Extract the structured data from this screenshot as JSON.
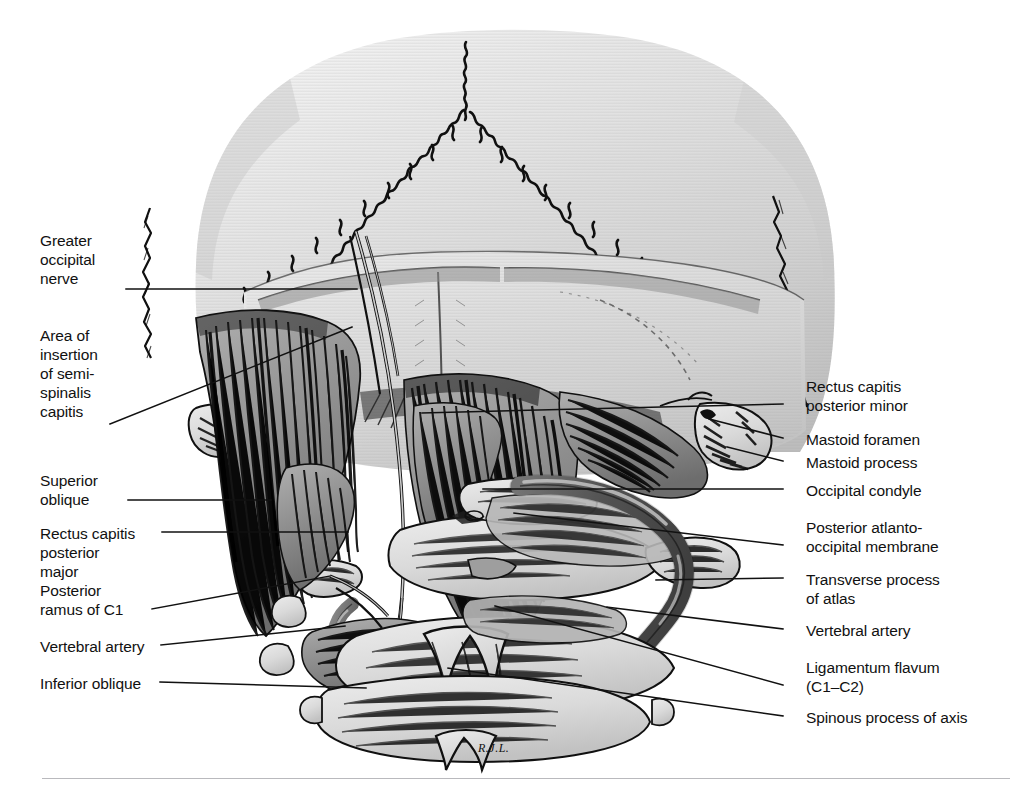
{
  "figure": {
    "artist_signature": "R.J.L.",
    "background_color": "#ffffff",
    "ink_color": "#000000",
    "bone_fill": "#d8d8d8",
    "muscle_fill": "#9a9a9a",
    "artery_fill": "#6f6f6f"
  },
  "labels_left": [
    {
      "id": "greater-occipital-nerve",
      "text": "Greater\noccipital\nnerve",
      "x": 40,
      "y": 231,
      "leader_from_x": 126,
      "leader_from_y": 289,
      "leader_to_x": 357,
      "leader_to_y": 289
    },
    {
      "id": "area-of-insertion-of-semispinalis-capitis",
      "text": "Area of\ninsertion\nof semi-\nspinalis\ncapitis",
      "x": 40,
      "y": 326,
      "leader_from_x": 110,
      "leader_from_y": 424,
      "leader_to_x": 352,
      "leader_to_y": 327
    },
    {
      "id": "superior-oblique",
      "text": "Superior\noblique",
      "x": 40,
      "y": 471,
      "leader_from_x": 128,
      "leader_from_y": 500,
      "leader_to_x": 271,
      "leader_to_y": 500
    },
    {
      "id": "rectus-capitis-posterior-major",
      "text": "Rectus capitis\nposterior\nmajor",
      "x": 40,
      "y": 524,
      "leader_from_x": 162,
      "leader_from_y": 532,
      "leader_to_x": 348,
      "leader_to_y": 532
    },
    {
      "id": "posterior-ramus-of-c1",
      "text": "Posterior\nramus of C1",
      "x": 40,
      "y": 581,
      "leader_from_x": 152,
      "leader_from_y": 609,
      "leader_to_x": 330,
      "leader_to_y": 576
    },
    {
      "id": "vertebral-artery",
      "text": "Vertebral artery",
      "x": 40,
      "y": 637,
      "leader_from_x": 161,
      "leader_from_y": 645,
      "leader_to_x": 345,
      "leader_to_y": 626
    },
    {
      "id": "inferior-oblique",
      "text": "Inferior oblique",
      "x": 40,
      "y": 674,
      "leader_from_x": 160,
      "leader_from_y": 682,
      "leader_to_x": 366,
      "leader_to_y": 688
    }
  ],
  "labels_right": [
    {
      "id": "rectus-capitis-posterior-minor",
      "text": "Rectus capitis\nposterior minor",
      "x": 806,
      "y": 377,
      "leader_from_x": 783,
      "leader_from_y": 404,
      "leader_to_x": 422,
      "leader_to_y": 413
    },
    {
      "id": "mastoid-foramen",
      "text": "Mastoid foramen",
      "x": 806,
      "y": 430,
      "leader_from_x": 783,
      "leader_from_y": 438,
      "leader_to_x": 709,
      "leader_to_y": 419
    },
    {
      "id": "mastoid-process",
      "text": "Mastoid process",
      "x": 806,
      "y": 453,
      "leader_from_x": 783,
      "leader_from_y": 461,
      "leader_to_x": 727,
      "leader_to_y": 447
    },
    {
      "id": "occipital-condyle",
      "text": "Occipital condyle",
      "x": 806,
      "y": 481,
      "leader_from_x": 783,
      "leader_from_y": 489,
      "leader_to_x": 483,
      "leader_to_y": 489
    },
    {
      "id": "posterior-atlanto-occipital-membrane",
      "text": "Posterior atlanto-\noccipital membrane",
      "x": 806,
      "y": 518,
      "leader_from_x": 783,
      "leader_from_y": 545,
      "leader_to_x": 514,
      "leader_to_y": 513
    },
    {
      "id": "transverse-process-of-atlas",
      "text": "Transverse process\nof atlas",
      "x": 806,
      "y": 570,
      "leader_from_x": 783,
      "leader_from_y": 578,
      "leader_to_x": 656,
      "leader_to_y": 580
    },
    {
      "id": "vertebral-artery-right",
      "text": "Vertebral artery",
      "x": 806,
      "y": 621,
      "leader_from_x": 783,
      "leader_from_y": 629,
      "leader_to_x": 607,
      "leader_to_y": 607
    },
    {
      "id": "ligamentum-flavum",
      "text": "Ligamentum flavum\n(C1–C2)",
      "x": 806,
      "y": 658,
      "leader_from_x": 783,
      "leader_from_y": 685,
      "leader_to_x": 495,
      "leader_to_y": 606
    },
    {
      "id": "spinous-process-of-axis",
      "text": "Spinous process of axis",
      "x": 806,
      "y": 708,
      "leader_from_x": 783,
      "leader_from_y": 716,
      "leader_to_x": 448,
      "leader_to_y": 668
    }
  ]
}
